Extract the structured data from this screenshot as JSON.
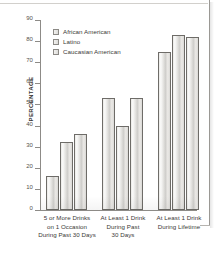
{
  "chart_data": {
    "type": "bar",
    "title": "",
    "xlabel": "",
    "ylabel": "PERCENTAGE",
    "ylim": [
      0,
      90
    ],
    "ytick_step": 10,
    "yticks": [
      0,
      10,
      20,
      30,
      40,
      50,
      60,
      70,
      80,
      90
    ],
    "grid": false,
    "legend_position": "top-left",
    "categories": [
      "5 or More Drinks on 1 Occasion During Past 30 Days",
      "At Least 1 Drink During Past 30 Days",
      "At Least 1 Drink During Lifetime"
    ],
    "category_lines": [
      [
        "5 or More Drinks",
        "on 1 Occasion",
        "During Past 30 Days"
      ],
      [
        "At Least 1 Drink",
        "During Past",
        "30 Days"
      ],
      [
        "At Least 1 Drink",
        "During Lifetime"
      ]
    ],
    "series": [
      {
        "name": "African American",
        "values": [
          16,
          53,
          75
        ]
      },
      {
        "name": "Latino",
        "values": [
          32,
          40,
          83
        ]
      },
      {
        "name": "Caucasian American",
        "values": [
          36,
          53,
          82
        ]
      }
    ]
  },
  "colors": {
    "bar_border": "#6e6c68",
    "axis": "#8d8b87",
    "text": "#3b3936",
    "page_edge": "#9a9894"
  }
}
